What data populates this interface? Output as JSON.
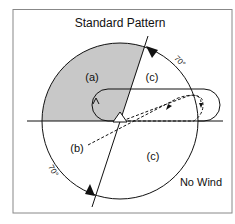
{
  "title": "Standard Pattern",
  "wind_label": "No Wind",
  "sectors": {
    "a": "(a)",
    "b": "(b)",
    "c_upper": "(c)",
    "c_lower": "(c)"
  },
  "angles": {
    "upper": "70°",
    "lower": "70°"
  },
  "colors": {
    "shaded_sector": "#c8c8c8",
    "line": "#111111",
    "frame": "#888888"
  }
}
